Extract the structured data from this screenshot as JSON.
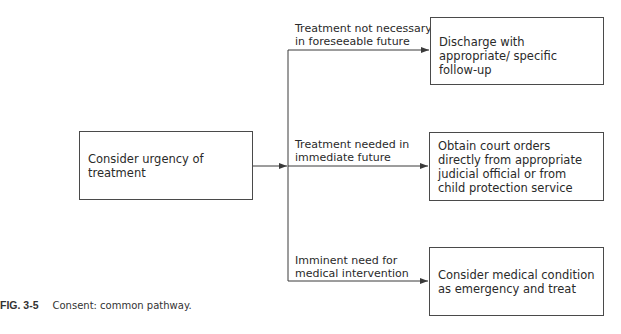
{
  "diagram": {
    "source": {
      "text": "Consider urgency of treatment"
    },
    "branches": [
      {
        "label_line1": "Treatment not necessary",
        "label_line2": "in foreseeable future",
        "target": "Discharge with appropriate/ specific follow-up"
      },
      {
        "label_line1": "Treatment needed in",
        "label_line2": "immediate future",
        "target": "Obtain court orders directly from appropriate judicial official or from child protection service"
      },
      {
        "label_line1": "Imminent need for",
        "label_line2": "medical intervention",
        "target": "Consider medical condition as emergency and treat"
      }
    ]
  },
  "caption": {
    "figure": "FIG. 3-5",
    "text": "Consent: common pathway."
  },
  "colors": {
    "line": "#3a3a3a",
    "text": "#2a2a2a",
    "background": "#ffffff"
  }
}
